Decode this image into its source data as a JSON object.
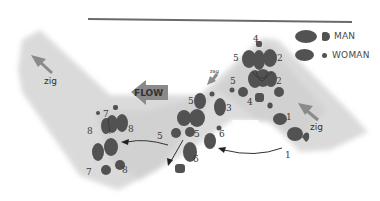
{
  "diagram": {
    "flow_label": "FLOW",
    "zig_labels": [
      "zig",
      "zag",
      "zig"
    ],
    "legend": {
      "man_label": "MAN",
      "woman_label": "WOMAN"
    },
    "step_numbers": {
      "n1a": "1",
      "n1b": "1",
      "n2a": "2",
      "n2b": "2",
      "n3": "3",
      "n4a": "4",
      "n4b": "4",
      "n5a": "5",
      "n5b": "5",
      "n5c": "5",
      "n5d": "5",
      "n5e": "5",
      "n6a": "6",
      "n6b": "6",
      "n7a": "7",
      "n7b": "7",
      "n8a": "8",
      "n8b": "8",
      "n8c": "8"
    },
    "colors": {
      "band": "#d9d9d9",
      "footprint": "#525252",
      "arrow_gray": "#8a8a8a",
      "line": "#555555"
    }
  }
}
